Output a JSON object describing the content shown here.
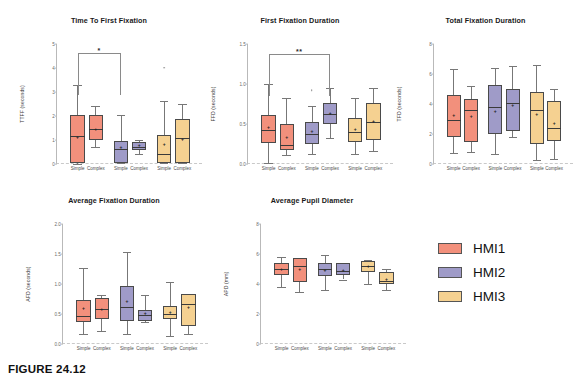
{
  "figure": {
    "caption": "FIGURE 24.12",
    "xgroup_labels": [
      "Simple",
      "Complex"
    ],
    "group_names": [
      "HMI1",
      "HMI2",
      "HMI3"
    ]
  },
  "legend": {
    "position": "right",
    "items": [
      {
        "label": "HMI1",
        "color": "#F2907C"
      },
      {
        "label": "HMI2",
        "color": "#9F9BC8"
      },
      {
        "label": "HMI3",
        "color": "#F5D191"
      }
    ]
  },
  "chart_data": [
    {
      "type": "box",
      "id": "ttff",
      "title": "Time To First Fixation",
      "xlabel": "",
      "ylabel": "TTFF  (seconds)",
      "ylim": [
        0,
        5
      ],
      "yticks": [
        0,
        1,
        2,
        3,
        4,
        5
      ],
      "ytick_labels": [
        "0",
        "1",
        "2",
        "3",
        "4",
        "5"
      ],
      "grid": false,
      "categories": [
        "Simple",
        "Complex",
        "Simple",
        "Complex",
        "Simple",
        "Complex"
      ],
      "series": [
        {
          "name": "HMI1",
          "color": "#F2907C",
          "boxes": [
            {
              "x": "Simple",
              "whisker_low": 0.02,
              "q1": 0.03,
              "median": 1.18,
              "q3": 2.03,
              "whisker_high": 3.3,
              "mean": 1.12,
              "outliers": []
            },
            {
              "x": "Complex",
              "whisker_low": 0.7,
              "q1": 1.02,
              "median": 1.45,
              "q3": 2.03,
              "whisker_high": 2.42,
              "mean": 1.46,
              "outliers": []
            }
          ]
        },
        {
          "name": "HMI2",
          "color": "#9F9BC8",
          "boxes": [
            {
              "x": "Simple",
              "whisker_low": 0.03,
              "q1": 0.03,
              "median": 0.62,
              "q3": 0.96,
              "whisker_high": 2.05,
              "mean": 0.72,
              "outliers": []
            },
            {
              "x": "Complex",
              "whisker_low": 0.42,
              "q1": 0.57,
              "median": 0.72,
              "q3": 0.92,
              "whisker_high": 1.02,
              "mean": 0.78,
              "outliers": []
            }
          ]
        },
        {
          "name": "HMI3",
          "color": "#F5D191",
          "boxes": [
            {
              "x": "Simple",
              "whisker_low": 0.03,
              "q1": 0.03,
              "median": 0.42,
              "q3": 1.22,
              "whisker_high": 2.62,
              "mean": 0.82,
              "outliers": [
                4.02
              ]
            },
            {
              "x": "Complex",
              "whisker_low": 0.03,
              "q1": 0.03,
              "median": 1.1,
              "q3": 1.88,
              "whisker_high": 2.52,
              "mean": 1.06,
              "outliers": []
            }
          ]
        }
      ],
      "annotations": [
        {
          "type": "significance-bracket",
          "from": "HMI1-Simple",
          "to": "HMI2-Simple",
          "label": "*",
          "y": 4.62
        }
      ]
    },
    {
      "type": "box",
      "id": "ffd",
      "title": "First Fixation Duration",
      "xlabel": "",
      "ylabel": "FFD (seconds)",
      "ylim": [
        0.0,
        1.5
      ],
      "yticks": [
        0.0,
        0.5,
        1.0,
        1.5
      ],
      "ytick_labels": [
        "0.0",
        "0.5",
        "1.0",
        "1.5"
      ],
      "grid": false,
      "categories": [
        "Simple",
        "Complex",
        "Simple",
        "Complex",
        "Simple",
        "Complex"
      ],
      "series": [
        {
          "name": "HMI1",
          "color": "#F2907C",
          "boxes": [
            {
              "x": "Simple",
              "whisker_low": 0.01,
              "q1": 0.26,
              "median": 0.43,
              "q3": 0.61,
              "whisker_high": 1.0,
              "mean": 0.46,
              "outliers": []
            },
            {
              "x": "Complex",
              "whisker_low": 0.11,
              "q1": 0.17,
              "median": 0.24,
              "q3": 0.5,
              "whisker_high": 0.82,
              "mean": 0.34,
              "outliers": []
            }
          ]
        },
        {
          "name": "HMI2",
          "color": "#9F9BC8",
          "boxes": [
            {
              "x": "Simple",
              "whisker_low": 0.12,
              "q1": 0.25,
              "median": 0.37,
              "q3": 0.53,
              "whisker_high": 0.72,
              "mean": 0.41,
              "outliers": [
                0.92
              ]
            },
            {
              "x": "Complex",
              "whisker_low": 0.33,
              "q1": 0.5,
              "median": 0.62,
              "q3": 0.76,
              "whisker_high": 0.95,
              "mean": 0.64,
              "outliers": []
            }
          ]
        },
        {
          "name": "HMI3",
          "color": "#F5D191",
          "boxes": [
            {
              "x": "Simple",
              "whisker_low": 0.12,
              "q1": 0.28,
              "median": 0.4,
              "q3": 0.58,
              "whisker_high": 0.83,
              "mean": 0.44,
              "outliers": []
            },
            {
              "x": "Complex",
              "whisker_low": 0.16,
              "q1": 0.3,
              "median": 0.52,
              "q3": 0.76,
              "whisker_high": 0.95,
              "mean": 0.54,
              "outliers": []
            }
          ]
        }
      ],
      "annotations": [
        {
          "type": "significance-bracket",
          "from": "HMI1-Simple",
          "to": "HMI2-Complex",
          "label": "**",
          "y": 1.37
        }
      ]
    },
    {
      "type": "box",
      "id": "tfd",
      "title": "Total Fixation Duration",
      "xlabel": "",
      "ylabel": "TFD (seconds)",
      "ylim": [
        0,
        8
      ],
      "yticks": [
        0,
        2,
        4,
        6,
        8
      ],
      "ytick_labels": [
        "0",
        "2",
        "4",
        "6",
        "8"
      ],
      "grid": false,
      "categories": [
        "Simple",
        "Complex",
        "Simple",
        "Complex",
        "Simple",
        "Complex"
      ],
      "series": [
        {
          "name": "HMI1",
          "color": "#F2907C",
          "boxes": [
            {
              "x": "Simple",
              "whisker_low": 0.72,
              "q1": 1.82,
              "median": 2.92,
              "q3": 4.58,
              "whisker_high": 6.35,
              "mean": 3.28,
              "outliers": []
            },
            {
              "x": "Complex",
              "whisker_low": 0.8,
              "q1": 1.45,
              "median": 3.6,
              "q3": 4.32,
              "whisker_high": 5.22,
              "mean": 3.2,
              "outliers": []
            }
          ]
        },
        {
          "name": "HMI2",
          "color": "#9F9BC8",
          "boxes": [
            {
              "x": "Simple",
              "whisker_low": 0.68,
              "q1": 2.02,
              "median": 3.8,
              "q3": 5.3,
              "whisker_high": 6.38,
              "mean": 3.52,
              "outliers": []
            },
            {
              "x": "Complex",
              "whisker_low": 1.82,
              "q1": 2.18,
              "median": 4.08,
              "q3": 4.98,
              "whisker_high": 6.55,
              "mean": 3.96,
              "outliers": []
            }
          ]
        },
        {
          "name": "HMI3",
          "color": "#F5D191",
          "boxes": [
            {
              "x": "Simple",
              "whisker_low": 0.28,
              "q1": 1.35,
              "median": 3.62,
              "q3": 4.8,
              "whisker_high": 6.62,
              "mean": 3.32,
              "outliers": []
            },
            {
              "x": "Complex",
              "whisker_low": 0.32,
              "q1": 1.52,
              "median": 2.4,
              "q3": 4.22,
              "whisker_high": 5.02,
              "mean": 2.72,
              "outliers": []
            }
          ]
        }
      ],
      "annotations": []
    },
    {
      "type": "box",
      "id": "afd",
      "title": "Average Fixation Duration",
      "xlabel": "",
      "ylabel": "AFD (seconds)",
      "ylim": [
        0.0,
        2.0
      ],
      "yticks": [
        0.0,
        0.5,
        1.0,
        1.5,
        2.0
      ],
      "ytick_labels": [
        "0.0",
        "0.5",
        "1.0",
        "1.5",
        "2.0"
      ],
      "grid": false,
      "categories": [
        "Simple",
        "Complex",
        "Simple",
        "Complex",
        "Simple",
        "Complex"
      ],
      "series": [
        {
          "name": "HMI1",
          "color": "#F2907C",
          "boxes": [
            {
              "x": "Simple",
              "whisker_low": 0.16,
              "q1": 0.36,
              "median": 0.46,
              "q3": 0.74,
              "whisker_high": 1.27,
              "mean": 0.6,
              "outliers": []
            },
            {
              "x": "Complex",
              "whisker_low": 0.22,
              "q1": 0.42,
              "median": 0.58,
              "q3": 0.76,
              "whisker_high": 0.81,
              "mean": 0.59,
              "outliers": []
            }
          ]
        },
        {
          "name": "HMI2",
          "color": "#9F9BC8",
          "boxes": [
            {
              "x": "Simple",
              "whisker_low": 0.17,
              "q1": 0.38,
              "median": 0.62,
              "q3": 0.97,
              "whisker_high": 1.53,
              "mean": 0.71,
              "outliers": []
            },
            {
              "x": "Complex",
              "whisker_low": 0.37,
              "q1": 0.39,
              "median": 0.48,
              "q3": 0.57,
              "whisker_high": 0.82,
              "mean": 0.51,
              "outliers": []
            }
          ]
        },
        {
          "name": "HMI3",
          "color": "#F5D191",
          "boxes": [
            {
              "x": "Simple",
              "whisker_low": 0.14,
              "q1": 0.42,
              "median": 0.5,
              "q3": 0.63,
              "whisker_high": 1.04,
              "mean": 0.54,
              "outliers": []
            },
            {
              "x": "Complex",
              "whisker_low": 0.17,
              "q1": 0.3,
              "median": 0.66,
              "q3": 0.83,
              "whisker_high": 0.83,
              "mean": 0.62,
              "outliers": []
            }
          ]
        }
      ],
      "annotations": []
    },
    {
      "type": "box",
      "id": "apd",
      "title": "Average Pupil Diameter",
      "xlabel": "",
      "ylabel": "APD (mm)",
      "ylim": [
        0,
        8
      ],
      "yticks": [
        0,
        2,
        4,
        6,
        8
      ],
      "ytick_labels": [
        "0",
        "2",
        "4",
        "6",
        "8"
      ],
      "grid": false,
      "categories": [
        "Simple",
        "Complex",
        "Simple",
        "Complex",
        "Simple",
        "Complex"
      ],
      "series": [
        {
          "name": "HMI1",
          "color": "#F2907C",
          "boxes": [
            {
              "x": "Simple",
              "whisker_low": 3.82,
              "q1": 4.6,
              "median": 5.02,
              "q3": 5.42,
              "whisker_high": 5.8,
              "mean": 5.0,
              "outliers": []
            },
            {
              "x": "Complex",
              "whisker_low": 3.45,
              "q1": 4.12,
              "median": 5.2,
              "q3": 5.72,
              "whisker_high": 5.62,
              "mean": 5.02,
              "outliers": []
            }
          ]
        },
        {
          "name": "HMI2",
          "color": "#9F9BC8",
          "boxes": [
            {
              "x": "Simple",
              "whisker_low": 3.62,
              "q1": 4.5,
              "median": 5.02,
              "q3": 5.42,
              "whisker_high": 5.92,
              "mean": 4.96,
              "outliers": []
            },
            {
              "x": "Complex",
              "whisker_low": 4.3,
              "q1": 4.62,
              "median": 4.88,
              "q3": 5.38,
              "whisker_high": 5.42,
              "mean": 4.95,
              "outliers": []
            }
          ]
        },
        {
          "name": "HMI3",
          "color": "#F5D191",
          "boxes": [
            {
              "x": "Simple",
              "whisker_low": 3.98,
              "q1": 4.8,
              "median": 5.22,
              "q3": 5.52,
              "whisker_high": 5.62,
              "mean": 5.18,
              "outliers": []
            },
            {
              "x": "Complex",
              "whisker_low": 3.58,
              "q1": 3.98,
              "median": 4.22,
              "q3": 4.78,
              "whisker_high": 5.02,
              "mean": 4.32,
              "outliers": []
            }
          ]
        }
      ],
      "annotations": []
    }
  ]
}
